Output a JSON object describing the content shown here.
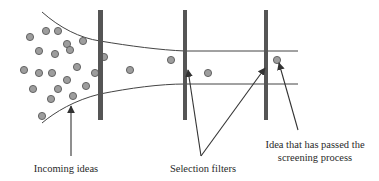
{
  "diagram": {
    "type": "idea screening funnel",
    "colors": {
      "filter_bar": "#555555",
      "funnel_line": "#444444",
      "idea_fill": "#9d9d9d",
      "idea_stroke": "#5a5a5a",
      "arrow": "#333333",
      "text": "#2a2a2a"
    },
    "funnel": {
      "top_path": "M 42 12 C 60 28, 80 38, 100 41 C 130 46, 160 50, 185 51 L 298 51",
      "bottom_path": "M 42 123 C 55 112, 75 100, 100 94 C 130 88, 160 84, 185 84 L 298 84"
    },
    "filters": [
      {
        "name": "filter-1",
        "x": 98,
        "y": 10,
        "width": 5,
        "height": 110
      },
      {
        "name": "filter-2",
        "x": 183,
        "y": 10,
        "width": 4,
        "height": 110
      },
      {
        "name": "filter-3",
        "x": 264,
        "y": 10,
        "width": 4,
        "height": 110
      }
    ],
    "incoming_ideas": [
      [
        30,
        37
      ],
      [
        46,
        31
      ],
      [
        58,
        31
      ],
      [
        67,
        44
      ],
      [
        70,
        50
      ],
      [
        39,
        51
      ],
      [
        55,
        54
      ],
      [
        83,
        41
      ],
      [
        24,
        70
      ],
      [
        39,
        73
      ],
      [
        52,
        73
      ],
      [
        77,
        67
      ],
      [
        95,
        73
      ],
      [
        67,
        80
      ],
      [
        33,
        89
      ],
      [
        58,
        89
      ],
      [
        86,
        86
      ],
      [
        51,
        99
      ],
      [
        73,
        96
      ],
      [
        42,
        116
      ]
    ],
    "ideas_after_filter_1": [
      [
        104,
        57
      ],
      [
        130,
        70
      ],
      [
        171,
        60
      ]
    ],
    "ideas_after_filter_2": [
      [
        208,
        73
      ]
    ],
    "passed_idea": [
      277,
      60
    ],
    "idea_radius": 3.6,
    "arrows": [
      {
        "name": "incoming-ideas-arrow",
        "from": [
          71,
          156
        ],
        "to": [
          71,
          106
        ]
      },
      {
        "name": "selection-filter-arrow-1",
        "from": [
          201,
          156
        ],
        "to": [
          188,
          70
        ]
      },
      {
        "name": "selection-filter-arrow-2",
        "from": [
          201,
          156
        ],
        "to": [
          265,
          68
        ]
      },
      {
        "name": "passed-idea-arrow",
        "from": [
          298,
          130
        ],
        "to": [
          279,
          63
        ]
      }
    ],
    "labels": {
      "incoming": "Incoming ideas",
      "filters": "Selection filters",
      "passed_line1": "Idea that has passed the",
      "passed_line2": "screening process"
    }
  }
}
